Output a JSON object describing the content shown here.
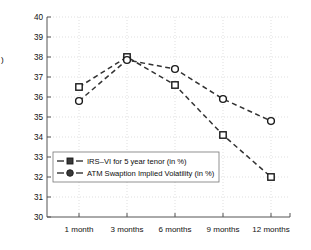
{
  "chart_data": {
    "type": "line",
    "title": "",
    "subtitle": "",
    "xlabel": "",
    "ylabel": "",
    "categories": [
      "1 month",
      "3 months",
      "6 months",
      "9 months",
      "12 months"
    ],
    "series": [
      {
        "name": "IRS–VI for 5 year tenor (in %)",
        "marker": "square",
        "linestyle": "dashed",
        "color": "#333333",
        "values": [
          36.5,
          38.0,
          36.6,
          34.1,
          32.0
        ]
      },
      {
        "name": "ATM Swaption Implied Volatility (in %)",
        "marker": "circle",
        "linestyle": "dashed",
        "color": "#333333",
        "values": [
          35.8,
          37.85,
          37.4,
          35.9,
          34.8
        ]
      }
    ],
    "ylim": [
      30,
      40
    ],
    "ytick_labels": [
      "30",
      "31",
      "32",
      "33",
      "34",
      "35",
      "36",
      "37",
      "38",
      "39",
      "40"
    ],
    "ytick_values": [
      30,
      31,
      32,
      33,
      34,
      35,
      36,
      37,
      38,
      39,
      40
    ],
    "grid": true,
    "grid_style": "dotted",
    "legend_position": "lower-left"
  },
  "legend": {
    "entries": [
      {
        "label": "IRS–VI for 5 year tenor (in %)",
        "marker": "square-marker-icon"
      },
      {
        "label": "ATM Swaption Implied Volatility (in %)",
        "marker": "circle-marker-icon"
      }
    ]
  },
  "axes": {
    "y_label_stub": ")"
  }
}
